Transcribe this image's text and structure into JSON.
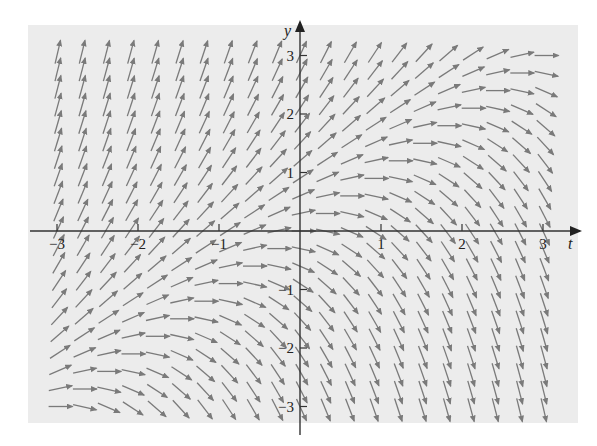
{
  "chart_data": {
    "type": "slope_field",
    "title": "",
    "equation_estimate": "dy/dt = y - t",
    "xlabel": "t",
    "ylabel": "y",
    "xlim": [
      -3,
      3
    ],
    "ylim": [
      -3,
      3
    ],
    "grid": false,
    "legend": null,
    "x_ticks": [
      -3,
      -2,
      -1,
      1,
      2,
      3
    ],
    "y_ticks": [
      -3,
      -2,
      -1,
      1,
      2,
      3
    ],
    "x_tick_labels": [
      "−3",
      "−2",
      "−1",
      "1",
      "2",
      "3"
    ],
    "y_tick_labels": [
      "−3",
      "−2",
      "−1",
      "1",
      "2",
      "3"
    ],
    "sample_grid": {
      "t_start": -3,
      "t_end": 3,
      "t_step": 0.3,
      "y_start": -3,
      "y_end": 3,
      "y_step": 0.3
    },
    "arrow_length_px": 24
  },
  "colors": {
    "panel_background": "#ececec",
    "page_background": "#ffffff",
    "arrow": "#7a7a7a",
    "axis": "#333333"
  },
  "layout": {
    "panel": {
      "x": 28,
      "y": 25,
      "w": 550,
      "h": 398
    },
    "origin_px": {
      "x": 300,
      "y": 231
    },
    "px_per_unit_x": 81,
    "px_per_unit_y": 58.5,
    "x_axis_end_px": 580,
    "y_axis_top_px": 22,
    "y_axis_bottom_px": 435
  }
}
